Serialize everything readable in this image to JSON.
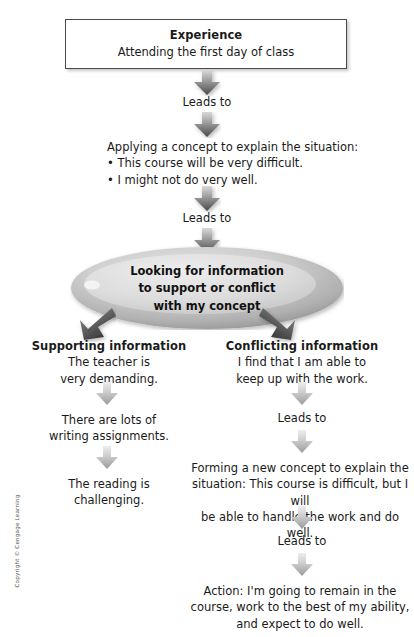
{
  "diagram": {
    "title_box": {
      "heading": "Experience",
      "subtext": "Attending the first day of class"
    },
    "connector_labels": {
      "leads_to_1": "Leads to",
      "leads_to_2": "Leads to",
      "leads_to_3": "Leads to",
      "leads_to_4": "Leads to",
      "leads_to_5": "Leads to"
    },
    "applying_block": {
      "line1": "Applying a concept to explain the situation:",
      "bullet1": "• This course will be very difficult.",
      "bullet2": "• I might not do very well."
    },
    "ellipse": {
      "line1": "Looking for information",
      "line2": "to support or conflict",
      "line3": "with my concept"
    },
    "left_branch": {
      "heading": "Supporting information",
      "item1_line1": "The teacher is",
      "item1_line2": "very demanding.",
      "item2_line1": "There are lots of",
      "item2_line2": "writing assignments.",
      "item3_line1": "The reading is",
      "item3_line2": "challenging."
    },
    "right_branch": {
      "heading": "Conflicting information",
      "item1_line1": "I find that I am able to",
      "item1_line2": "keep up with the work.",
      "forming_line1": "Forming a new concept to explain the",
      "forming_line2": "situation: This course is difficult, but I will",
      "forming_line3": "be able to handle the work and do well.",
      "action_line1": "Action: I'm going to remain in the",
      "action_line2": "course, work to the best of my ability,",
      "action_line3": "and expect to do well."
    },
    "footer": {
      "copyright": "Copyright © Cengage Learning"
    },
    "colors": {
      "text": "#1a1a1a",
      "box_border": "#4a4a4a",
      "arrow_dark_top": "#cfcfcf",
      "arrow_dark_bottom": "#4c4c4c",
      "arrow_light_top": "#e6e6e6",
      "arrow_light_bottom": "#9c9c9c",
      "ellipse_fill_light": "#d7d7d7",
      "ellipse_fill_dark": "#9a9a9a",
      "background": "#ffffff"
    }
  }
}
